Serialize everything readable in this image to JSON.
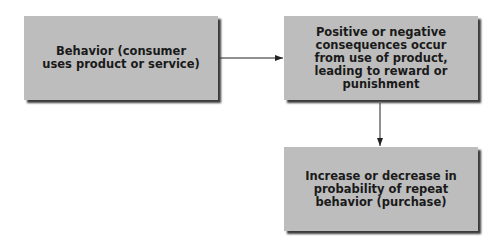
{
  "diagram": {
    "type": "flowchart",
    "nodes": [
      {
        "id": "behavior",
        "label": "Behavior (consumer\nuses product or service)"
      },
      {
        "id": "consequences",
        "label": "Positive or negative\nconsequences occur\nfrom use of product,\nleading to reward or\npunishment"
      },
      {
        "id": "probability",
        "label": "Increase or decrease in\nprobability of repeat\nbehavior (purchase)"
      }
    ],
    "edges": [
      {
        "from": "behavior",
        "to": "consequences",
        "direction": "right"
      },
      {
        "from": "consequences",
        "to": "probability",
        "direction": "down"
      }
    ],
    "colors": {
      "box_fill": "#bdbdbd",
      "box_shadow": "#3a3a3a",
      "text": "#1a1a1a",
      "arrow": "#222222",
      "background": "#ffffff"
    }
  }
}
